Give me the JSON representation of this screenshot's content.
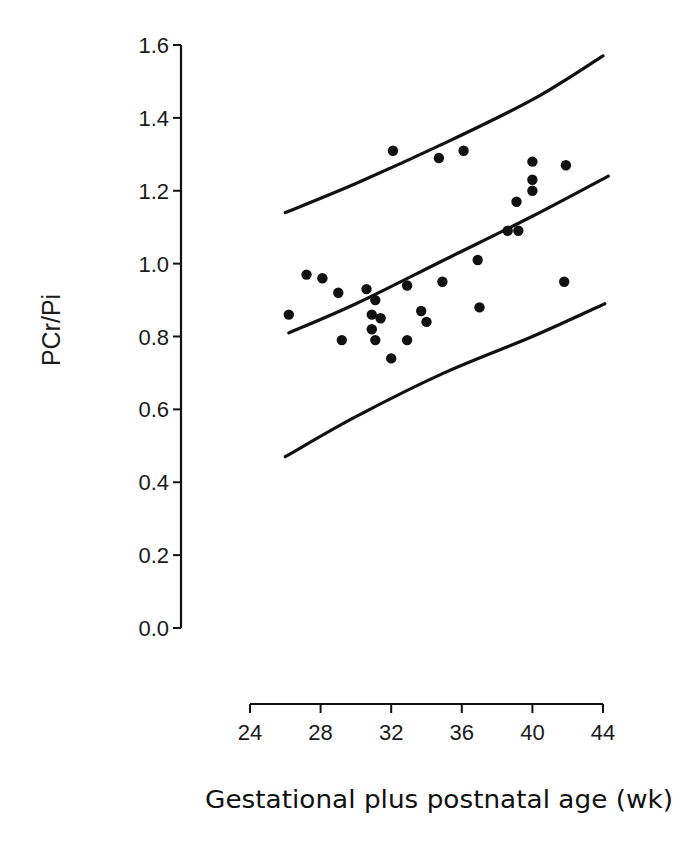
{
  "chart_data": {
    "type": "scatter",
    "title": "",
    "xlabel": "Gestational plus postnatal age (wk)",
    "ylabel": "PCr/Pi",
    "xlim": [
      24,
      44
    ],
    "ylim": [
      0.0,
      1.6
    ],
    "x_ticks": [
      "24",
      "28",
      "32",
      "36",
      "40",
      "44"
    ],
    "y_ticks": [
      "0.0",
      "0.2",
      "0.4",
      "0.6",
      "0.8",
      "1.0",
      "1.2",
      "1.4",
      "1.6"
    ],
    "grid": false,
    "legend": null,
    "series": [
      {
        "name": "observations",
        "kind": "points",
        "x": [
          26.2,
          27.2,
          28.1,
          29.0,
          29.2,
          30.6,
          30.9,
          30.9,
          31.1,
          31.1,
          31.4,
          32.0,
          32.1,
          32.9,
          32.9,
          33.7,
          34.0,
          34.7,
          34.9,
          36.1,
          36.9,
          37.0,
          38.6,
          39.1,
          39.2,
          40.0,
          40.0,
          40.0,
          41.8,
          41.9
        ],
        "y": [
          0.86,
          0.97,
          0.96,
          0.92,
          0.79,
          0.93,
          0.82,
          0.86,
          0.79,
          0.9,
          0.85,
          0.74,
          1.31,
          0.94,
          0.79,
          0.87,
          0.84,
          1.29,
          0.95,
          1.31,
          1.01,
          0.88,
          1.09,
          1.17,
          1.09,
          1.28,
          1.2,
          1.23,
          0.95,
          1.27
        ]
      },
      {
        "name": "regression line",
        "kind": "line",
        "x": [
          26.2,
          30,
          35,
          40,
          44.3
        ],
        "y": [
          0.81,
          0.89,
          1.01,
          1.13,
          1.24
        ]
      },
      {
        "name": "upper prediction limit",
        "kind": "line",
        "x": [
          26.0,
          30,
          35,
          40,
          44.0
        ],
        "y": [
          1.14,
          1.22,
          1.33,
          1.45,
          1.57
        ]
      },
      {
        "name": "lower prediction limit",
        "kind": "line",
        "x": [
          26.0,
          30,
          35,
          40,
          44.1
        ],
        "y": [
          0.47,
          0.58,
          0.7,
          0.8,
          0.89
        ]
      }
    ]
  },
  "colors": {
    "ink": "#111111",
    "background": "#ffffff"
  }
}
